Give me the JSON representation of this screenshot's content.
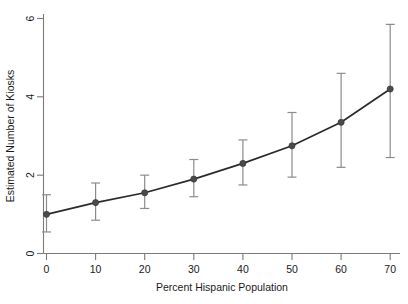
{
  "chart_data": {
    "type": "line",
    "title": "",
    "subtitle": "",
    "xlabel": "Percent Hispanic Population",
    "ylabel": "Estimated Number of Kiosks",
    "x": [
      0,
      10,
      20,
      30,
      40,
      50,
      60,
      70
    ],
    "values": [
      1.0,
      1.3,
      1.55,
      1.9,
      2.3,
      2.75,
      3.35,
      4.2
    ],
    "error_low": [
      0.55,
      0.85,
      1.15,
      1.45,
      1.75,
      1.95,
      2.2,
      2.45
    ],
    "error_high": [
      1.5,
      1.8,
      2.0,
      2.4,
      2.9,
      3.6,
      4.6,
      5.85
    ],
    "series": [
      {
        "name": "Estimated Number of Kiosks",
        "values": [
          1.0,
          1.3,
          1.55,
          1.9,
          2.3,
          2.75,
          3.35,
          4.2
        ]
      }
    ],
    "xlim": [
      0,
      73
    ],
    "ylim": [
      0,
      6.1
    ],
    "xticks": [
      0,
      10,
      20,
      30,
      40,
      50,
      60,
      70
    ],
    "yticks": [
      0,
      2,
      4,
      6
    ],
    "xtick_labels": [
      "0",
      "10",
      "20",
      "30",
      "40",
      "50",
      "60",
      "70"
    ],
    "ytick_labels": [
      "0",
      "2",
      "4",
      "6"
    ],
    "grid": false,
    "legend": false,
    "legend_position": "none",
    "error_bars": true,
    "marker": "circle",
    "colors": {
      "line": "#2b2b2b",
      "marker": "#4a4a4a",
      "error_bar": "#8c8c8c",
      "axis": "#7a7a7a",
      "text": "#1a1a1a",
      "background": "#ffffff"
    }
  },
  "axes": {
    "x_title": "Percent Hispanic Population",
    "y_title": "Estimated Number of Kiosks"
  }
}
